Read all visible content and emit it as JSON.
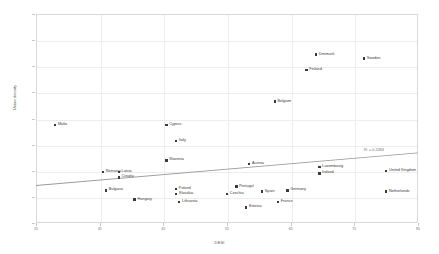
{
  "chart_data": {
    "type": "scatter",
    "title": "",
    "xlabel": "DESI",
    "ylabel": "Union density",
    "xlim": [
      25,
      85
    ],
    "ylim": [
      0,
      80
    ],
    "xticks": [
      25,
      35,
      45,
      55,
      65,
      75,
      85
    ],
    "yticks": [
      0,
      10,
      20,
      30,
      40,
      50,
      60,
      70,
      80
    ],
    "grid": true,
    "legend": "none",
    "annotations": [
      {
        "text": "R² = 0.2284",
        "x": 76.5,
        "y": 27.5
      }
    ],
    "trendline": {
      "x_start": 25,
      "y_start": 14.5,
      "x_end": 85,
      "y_end": 27.0
    },
    "points": [
      {
        "label": "Malta",
        "x": 28.0,
        "y": 40.0
      },
      {
        "label": "Cyprus",
        "x": 45.5,
        "y": 40.0
      },
      {
        "label": "Italy",
        "x": 47.0,
        "y": 34.0
      },
      {
        "label": "Denmark",
        "x": 69.0,
        "y": 67.0
      },
      {
        "label": "Sweden",
        "x": 76.5,
        "y": 65.5
      },
      {
        "label": "Finland",
        "x": 67.5,
        "y": 61.0
      },
      {
        "label": "Belgium",
        "x": 62.5,
        "y": 49.0
      },
      {
        "label": "Slovenia",
        "x": 45.5,
        "y": 26.5
      },
      {
        "label": "Austria",
        "x": 58.5,
        "y": 25.0
      },
      {
        "label": "Luxembourg",
        "x": 69.5,
        "y": 24.0
      },
      {
        "label": "Ireland",
        "x": 69.5,
        "y": 21.5
      },
      {
        "label": "Romania",
        "x": 35.5,
        "y": 22.0
      },
      {
        "label": "Latvia",
        "x": 38.0,
        "y": 22.0
      },
      {
        "label": "Croatia",
        "x": 38.0,
        "y": 20.0
      },
      {
        "label": "United Kingdom",
        "x": 80.0,
        "y": 22.5
      },
      {
        "label": "Bulgaria",
        "x": 36.0,
        "y": 15.0
      },
      {
        "label": "Poland",
        "x": 47.0,
        "y": 15.5
      },
      {
        "label": "Slovakia",
        "x": 47.0,
        "y": 13.5
      },
      {
        "label": "Netherlands",
        "x": 80.0,
        "y": 14.5
      },
      {
        "label": "Germany",
        "x": 64.5,
        "y": 15.0
      },
      {
        "label": "Portugal",
        "x": 56.5,
        "y": 16.5
      },
      {
        "label": "Spain",
        "x": 60.5,
        "y": 14.5
      },
      {
        "label": "Czechia",
        "x": 55.0,
        "y": 13.5
      },
      {
        "label": "Hungary",
        "x": 40.5,
        "y": 11.5
      },
      {
        "label": "Lithuania",
        "x": 47.5,
        "y": 10.5
      },
      {
        "label": "France",
        "x": 63.0,
        "y": 10.5
      },
      {
        "label": "Estonia",
        "x": 58.0,
        "y": 8.5
      }
    ]
  }
}
